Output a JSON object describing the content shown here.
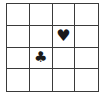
{
  "board": {
    "rows": 4,
    "cols": 4,
    "line_color": "#3a3a3a",
    "symbol_color": "#1a1a1a",
    "cells": [
      [
        "",
        "",
        "",
        ""
      ],
      [
        "",
        "",
        "♥",
        ""
      ],
      [
        "",
        "♣",
        "",
        ""
      ],
      [
        "",
        "",
        "",
        ""
      ]
    ],
    "pieces": [
      {
        "name": "heart",
        "glyph": "♥",
        "row": 2,
        "col": 3
      },
      {
        "name": "club",
        "glyph": "♣",
        "row": 3,
        "col": 2
      }
    ]
  }
}
